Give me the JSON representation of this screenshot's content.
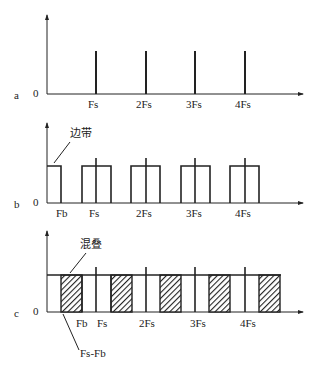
{
  "panels": [
    {
      "id": "a",
      "label": "a",
      "origin": "0",
      "ticks": [
        "Fs",
        "2Fs",
        "3Fs",
        "4Fs"
      ],
      "description": "Spectral lines at multiples of sampling frequency"
    },
    {
      "id": "b",
      "label": "b",
      "origin": "0",
      "ticks": [
        "Fb",
        "Fs",
        "2Fs",
        "3Fs",
        "4Fs"
      ],
      "annotation": "边带"
    },
    {
      "id": "c",
      "label": "c",
      "origin": "0",
      "ticks": [
        "Fb",
        "Fs",
        "2Fs",
        "3Fs",
        "4Fs"
      ],
      "annotation_top": "混叠",
      "annotation_bottom": "Fs-Fb"
    }
  ],
  "colors": {
    "line": "#222222",
    "background": "#ffffff"
  }
}
